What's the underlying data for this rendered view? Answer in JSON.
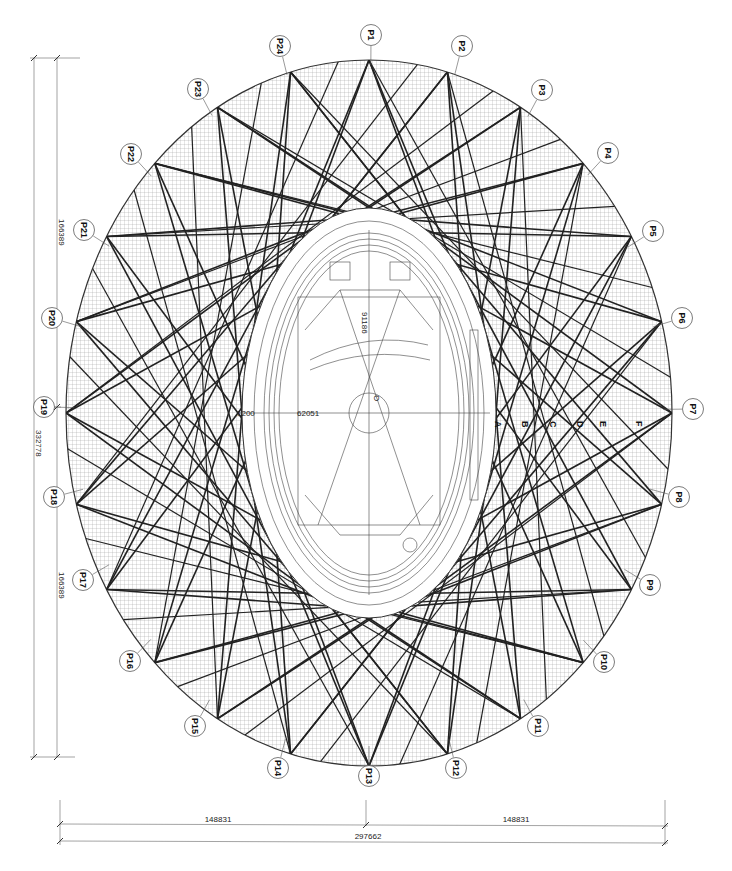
{
  "drawing": {
    "subject": "Stadium roof structural plan",
    "colors": {
      "line": "#222222",
      "hatch": "#888888",
      "background": "#ffffff"
    }
  },
  "dimensions": {
    "vertical_total": "332778",
    "vertical_top_half": "166389",
    "vertical_bottom_half": "166389",
    "horizontal_left_half": "148831",
    "horizontal_right_half": "148831",
    "horizontal_total": "297662"
  },
  "field": {
    "width_label": "62051",
    "offset_label": "1200",
    "length_label": "91186",
    "center_label": "O"
  },
  "section_markers": [
    "A",
    "B",
    "C",
    "D",
    "E",
    "F"
  ],
  "callouts": [
    {
      "id": "P1",
      "x": 371,
      "y": 35
    },
    {
      "id": "P2",
      "x": 462,
      "y": 46
    },
    {
      "id": "P3",
      "x": 542,
      "y": 90
    },
    {
      "id": "P4",
      "x": 608,
      "y": 153
    },
    {
      "id": "P5",
      "x": 653,
      "y": 231
    },
    {
      "id": "P6",
      "x": 682,
      "y": 318
    },
    {
      "id": "P7",
      "x": 693,
      "y": 409
    },
    {
      "id": "P8",
      "x": 679,
      "y": 497
    },
    {
      "id": "P9",
      "x": 650,
      "y": 585
    },
    {
      "id": "P10",
      "x": 604,
      "y": 662
    },
    {
      "id": "P11",
      "x": 538,
      "y": 726
    },
    {
      "id": "P12",
      "x": 456,
      "y": 768
    },
    {
      "id": "P13",
      "x": 369,
      "y": 776
    },
    {
      "id": "P14",
      "x": 278,
      "y": 768
    },
    {
      "id": "P15",
      "x": 195,
      "y": 726
    },
    {
      "id": "P16",
      "x": 130,
      "y": 661
    },
    {
      "id": "P17",
      "x": 83,
      "y": 580
    },
    {
      "id": "P18",
      "x": 54,
      "y": 497
    },
    {
      "id": "P19",
      "x": 44,
      "y": 407
    },
    {
      "id": "P20",
      "x": 52,
      "y": 318
    },
    {
      "id": "P21",
      "x": 84,
      "y": 230
    },
    {
      "id": "P22",
      "x": 131,
      "y": 154
    },
    {
      "id": "P23",
      "x": 198,
      "y": 89
    },
    {
      "id": "P24",
      "x": 280,
      "y": 46
    }
  ]
}
